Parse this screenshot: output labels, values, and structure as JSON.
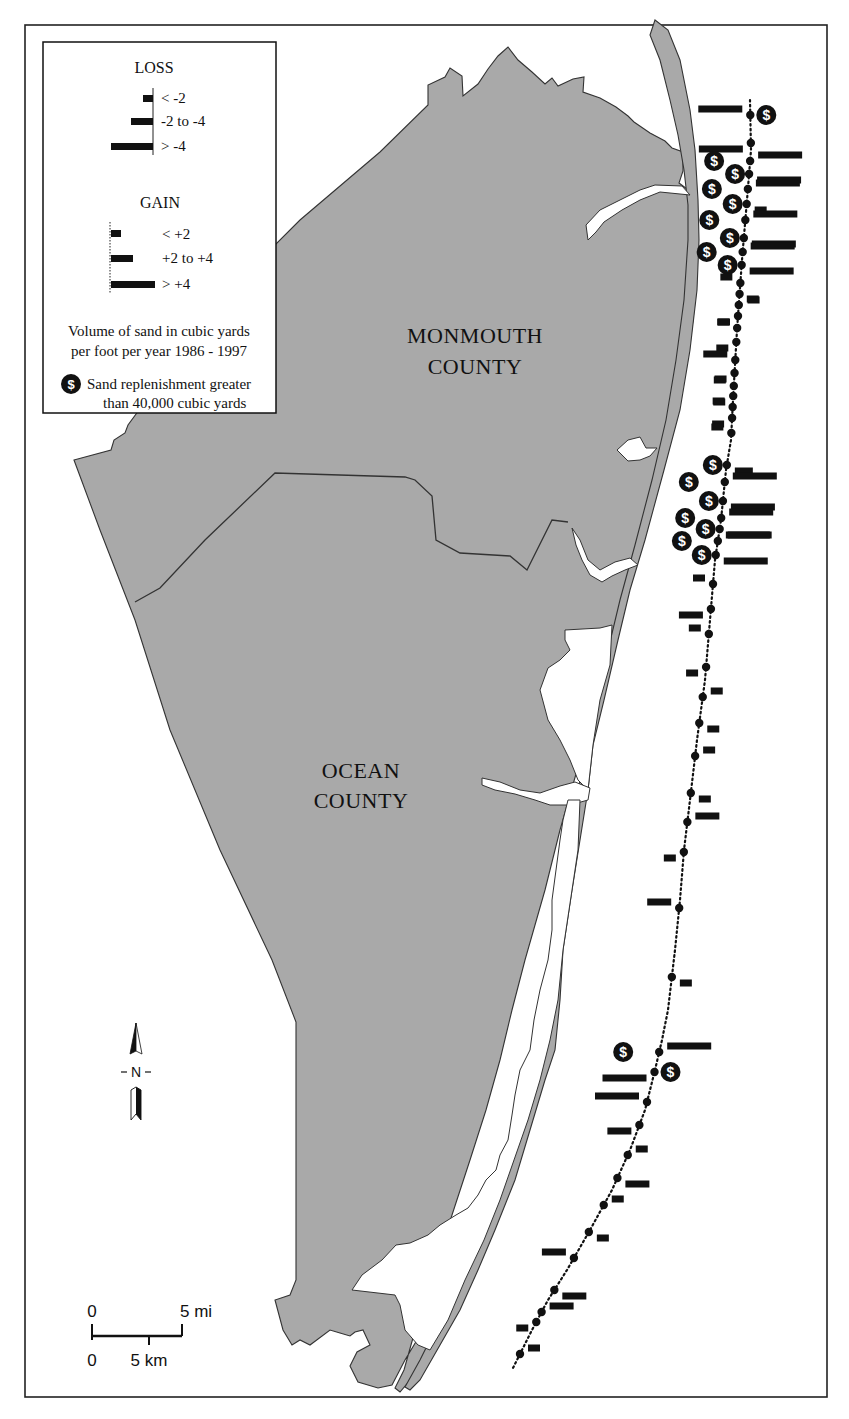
{
  "map": {
    "title": "",
    "labels": {
      "monmouth_line1": "MONMOUTH",
      "monmouth_line2": "COUNTY",
      "ocean_line1": "OCEAN",
      "ocean_line2": "COUNTY"
    },
    "colors": {
      "land": "#a9a9a9",
      "water": "#ffffff",
      "bars": "#111111",
      "outline": "#333333"
    }
  },
  "legend": {
    "loss_heading": "LOSS",
    "loss_items": [
      {
        "label": "< -2",
        "bar_length": 10
      },
      {
        "label": "-2 to -4",
        "bar_length": 22
      },
      {
        "label": "> -4",
        "bar_length": 42
      }
    ],
    "gain_heading": "GAIN",
    "gain_items": [
      {
        "label": "< +2",
        "bar_length": 10
      },
      {
        "label": "+2 to +4",
        "bar_length": 22
      },
      {
        "label": "> +4",
        "bar_length": 44
      }
    ],
    "units_line1": "Volume of sand in cubic yards",
    "units_line2": "per foot per year  1986 - 1997",
    "replenishment_line1": "Sand replenishment greater",
    "replenishment_line2": "than 40,000 cubic yards",
    "replenishment_icon": "dollar-circle-icon"
  },
  "north_arrow": {
    "label": "N"
  },
  "scale_bar": {
    "top_left": "0",
    "top_right": "5 mi",
    "bottom_left": "0",
    "bottom_right": "5 km"
  },
  "chart_data": {
    "type": "bar",
    "title": "Volume of sand in cubic yards per foot per year 1986 - 1997",
    "categories_legend": {
      "loss": [
        "< -2",
        "-2 to -4",
        "> -4"
      ],
      "gain": [
        "< +2",
        "+2 to +4",
        "> +4"
      ]
    },
    "stations": [
      {
        "id": 1,
        "y": 115,
        "change": "> -4",
        "replenished": true
      },
      {
        "id": 2,
        "y": 143,
        "change": "> -4",
        "replenished": false
      },
      {
        "id": 3,
        "y": 161,
        "change": "> +4",
        "replenished": true
      },
      {
        "id": 4,
        "y": 174,
        "change": "> +4",
        "replenished": true
      },
      {
        "id": 5,
        "y": 189,
        "change": "> +4",
        "replenished": true
      },
      {
        "id": 6,
        "y": 204,
        "change": "< +2",
        "replenished": true
      },
      {
        "id": 7,
        "y": 220,
        "change": "> +4",
        "replenished": true
      },
      {
        "id": 8,
        "y": 238,
        "change": "> +4",
        "replenished": true
      },
      {
        "id": 9,
        "y": 252,
        "change": "> +4",
        "replenished": true
      },
      {
        "id": 10,
        "y": 265,
        "change": "> +4",
        "replenished": true
      },
      {
        "id": 11,
        "y": 283,
        "change": "< -2",
        "replenished": false
      },
      {
        "id": 12,
        "y": 294,
        "change": "< +2",
        "replenished": false
      },
      {
        "id": 13,
        "y": 305,
        "change": "< +2",
        "replenished": false
      },
      {
        "id": 14,
        "y": 316,
        "change": "< -2",
        "replenished": false
      },
      {
        "id": 15,
        "y": 328,
        "change": "< -2",
        "replenished": false
      },
      {
        "id": 16,
        "y": 342,
        "change": "< -2",
        "replenished": false
      },
      {
        "id": 17,
        "y": 360,
        "change": "-2 to -4",
        "replenished": false
      },
      {
        "id": 18,
        "y": 373,
        "change": "< -2",
        "replenished": false
      },
      {
        "id": 19,
        "y": 386,
        "change": "< -2",
        "replenished": false
      },
      {
        "id": 20,
        "y": 396,
        "change": "< -2",
        "replenished": false
      },
      {
        "id": 21,
        "y": 407,
        "change": "< -2",
        "replenished": false
      },
      {
        "id": 22,
        "y": 418,
        "change": "< -2",
        "replenished": false
      },
      {
        "id": 23,
        "y": 433,
        "change": "< -2",
        "replenished": false
      },
      {
        "id": 24,
        "y": 465,
        "change": "< +4",
        "replenished": true
      },
      {
        "id": 25,
        "y": 482,
        "change": "> +4",
        "replenished": true
      },
      {
        "id": 26,
        "y": 501,
        "change": "> +4",
        "replenished": true
      },
      {
        "id": 27,
        "y": 518,
        "change": "> +4",
        "replenished": true
      },
      {
        "id": 28,
        "y": 529,
        "change": "> +4",
        "replenished": true
      },
      {
        "id": 29,
        "y": 541,
        "change": "> +4",
        "replenished": true
      },
      {
        "id": 30,
        "y": 555,
        "change": "> +4",
        "replenished": true
      },
      {
        "id": 31,
        "y": 584,
        "change": "< -2",
        "replenished": false
      },
      {
        "id": 32,
        "y": 609,
        "change": "-2 to -4",
        "replenished": false
      },
      {
        "id": 33,
        "y": 634,
        "change": "< -2",
        "replenished": false
      },
      {
        "id": 34,
        "y": 667,
        "change": "< -2",
        "replenished": false
      },
      {
        "id": 35,
        "y": 697,
        "change": "< +2",
        "replenished": false
      },
      {
        "id": 36,
        "y": 723,
        "change": "< +2",
        "replenished": false
      },
      {
        "id": 37,
        "y": 756,
        "change": "< +2",
        "replenished": false
      },
      {
        "id": 38,
        "y": 793,
        "change": "< +2",
        "replenished": false
      },
      {
        "id": 39,
        "y": 822,
        "change": "+2 to +4",
        "replenished": false
      },
      {
        "id": 40,
        "y": 852,
        "change": "< -2",
        "replenished": false
      },
      {
        "id": 41,
        "y": 908,
        "change": "-2 to -4",
        "replenished": false
      },
      {
        "id": 42,
        "y": 977,
        "change": "< +2",
        "replenished": false
      },
      {
        "id": 43,
        "y": 1052,
        "change": "> +4",
        "replenished": true
      },
      {
        "id": 44,
        "y": 1072,
        "change": "> -4",
        "replenished": true
      },
      {
        "id": 45,
        "y": 1102,
        "change": "> -4",
        "replenished": false
      },
      {
        "id": 46,
        "y": 1125,
        "change": "-2 to -4",
        "replenished": false
      },
      {
        "id": 47,
        "y": 1155,
        "change": "< +2",
        "replenished": false
      },
      {
        "id": 48,
        "y": 1178,
        "change": "+2 to +4",
        "replenished": false
      },
      {
        "id": 49,
        "y": 1205,
        "change": "< +2",
        "replenished": false
      },
      {
        "id": 50,
        "y": 1232,
        "change": "< +2",
        "replenished": false
      },
      {
        "id": 51,
        "y": 1258,
        "change": "-2 to -4",
        "replenished": false
      },
      {
        "id": 52,
        "y": 1290,
        "change": "+2 to +4",
        "replenished": false
      },
      {
        "id": 53,
        "y": 1312,
        "change": "+2 to +4",
        "replenished": false
      },
      {
        "id": 54,
        "y": 1322,
        "change": "< -2",
        "replenished": false
      },
      {
        "id": 55,
        "y": 1354,
        "change": "< +2",
        "replenished": false
      }
    ]
  }
}
